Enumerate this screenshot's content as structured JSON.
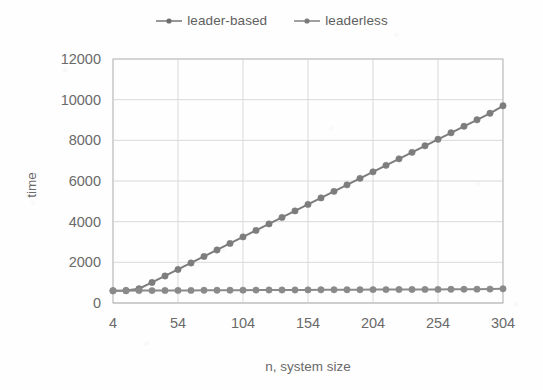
{
  "chart": {
    "legend": [
      {
        "label": "leader-based",
        "marker": "circle-line-marker",
        "color": "#7d7d7d"
      },
      {
        "label": "leaderless",
        "marker": "circle-line-marker",
        "color": "#8a8a8a"
      }
    ],
    "y_axis_title": "time",
    "x_axis_title": "n, system size",
    "grid_color": "#d9d9d9",
    "axis_color": "#bdbdbd",
    "text_color": "#6a6a6a"
  },
  "chart_data": {
    "type": "line",
    "title": "",
    "xlabel": "n, system size",
    "ylabel": "time",
    "xlim": [
      4,
      304
    ],
    "ylim": [
      0,
      12000
    ],
    "xticks": [
      4,
      54,
      104,
      154,
      204,
      254,
      304
    ],
    "yticks": [
      0,
      2000,
      4000,
      6000,
      8000,
      10000,
      12000
    ],
    "grid": true,
    "legend_position": "top-center",
    "x": [
      4,
      14,
      24,
      34,
      44,
      54,
      64,
      74,
      84,
      94,
      104,
      114,
      124,
      134,
      144,
      154,
      164,
      174,
      184,
      194,
      204,
      214,
      224,
      234,
      244,
      254,
      264,
      274,
      284,
      294,
      304
    ],
    "series": [
      {
        "name": "leader-based",
        "color": "#7d7d7d",
        "values": [
          600,
          620,
          700,
          1010,
          1330,
          1650,
          1970,
          2290,
          2610,
          2930,
          3250,
          3570,
          3890,
          4210,
          4530,
          4850,
          5170,
          5490,
          5810,
          6130,
          6450,
          6770,
          7090,
          7410,
          7730,
          8050,
          8370,
          8690,
          9010,
          9330,
          9700
        ]
      },
      {
        "name": "leaderless",
        "color": "#8a8a8a",
        "values": [
          600,
          600,
          610,
          610,
          615,
          620,
          620,
          625,
          628,
          630,
          632,
          635,
          638,
          640,
          642,
          645,
          648,
          650,
          652,
          655,
          658,
          660,
          663,
          665,
          668,
          670,
          673,
          676,
          680,
          684,
          700
        ]
      }
    ]
  }
}
